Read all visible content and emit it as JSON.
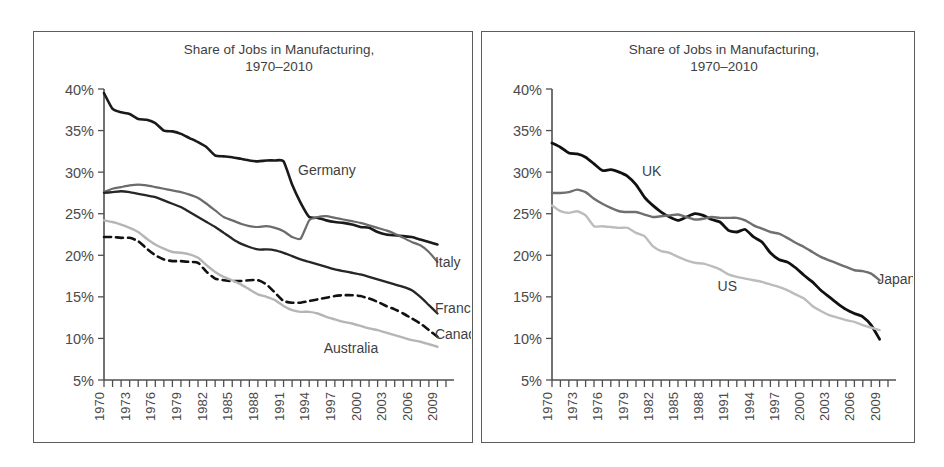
{
  "figure": {
    "background": "#ffffff",
    "frame_color": "#5c5c5c"
  },
  "chart_data": [
    {
      "panel": "left",
      "type": "line",
      "title": "Share of Jobs in Manufacturing,\n1970–2010",
      "title_line1": "Share of Jobs in Manufacturing,",
      "title_line2": "1970–2010",
      "xlabel": "",
      "ylabel": "",
      "ylim": [
        5,
        40
      ],
      "yticks": [
        5,
        10,
        15,
        20,
        25,
        30,
        35,
        40
      ],
      "ytick_labels": [
        "5%",
        "10%",
        "15%",
        "20%",
        "25%",
        "30%",
        "35%",
        "40%"
      ],
      "xlim": [
        1970,
        2010
      ],
      "xticks_every": 1,
      "xtick_labels": [
        "1970",
        "1973",
        "1976",
        "1979",
        "1982",
        "1985",
        "1988",
        "1991",
        "1994",
        "1997",
        "2000",
        "2003",
        "2006",
        "2009"
      ],
      "xtick_label_years": [
        1970,
        1973,
        1976,
        1979,
        1982,
        1985,
        1988,
        1991,
        1994,
        1997,
        2000,
        2003,
        2006,
        2009
      ],
      "grid": false,
      "legend_position": "inline-annotations",
      "x": [
        1970,
        1971,
        1972,
        1973,
        1974,
        1975,
        1976,
        1977,
        1978,
        1979,
        1980,
        1981,
        1982,
        1983,
        1984,
        1985,
        1986,
        1987,
        1988,
        1989,
        1990,
        1991,
        1992,
        1993,
        1994,
        1995,
        1996,
        1997,
        1998,
        1999,
        2000,
        2001,
        2002,
        2003,
        2004,
        2005,
        2006,
        2007,
        2008,
        2009
      ],
      "series": [
        {
          "name": "Germany",
          "color": "#1a1a1a",
          "style": "solid",
          "width": 2.6,
          "label_x": 1992,
          "label_y": 30.3,
          "values": [
            39.5,
            37.6,
            37.2,
            37.0,
            36.4,
            36.3,
            35.9,
            35.0,
            34.9,
            34.6,
            34.1,
            33.6,
            33.0,
            32.0,
            31.9,
            31.8,
            31.6,
            31.4,
            31.3,
            31.4,
            31.4,
            31.3,
            28.5,
            26.3,
            24.6,
            24.5,
            24.2,
            24.0,
            23.9,
            23.7,
            23.4,
            23.3,
            22.8,
            22.5,
            22.4,
            22.3,
            22.2,
            21.9,
            21.6,
            21.3
          ]
        },
        {
          "name": "Italy",
          "color": "#6b6b6b",
          "style": "solid",
          "width": 2.2,
          "label_x": 2008,
          "label_y": 19.2,
          "values": [
            27.6,
            28.0,
            28.2,
            28.4,
            28.5,
            28.4,
            28.2,
            28.0,
            27.8,
            27.6,
            27.3,
            26.9,
            26.2,
            25.4,
            24.6,
            24.2,
            23.8,
            23.5,
            23.4,
            23.5,
            23.3,
            22.9,
            22.2,
            22.0,
            24.2,
            24.6,
            24.7,
            24.5,
            24.3,
            24.1,
            23.9,
            23.6,
            23.3,
            23.0,
            22.6,
            22.1,
            21.6,
            21.2,
            20.4,
            19.2
          ]
        },
        {
          "name": "France",
          "color": "#262626",
          "style": "solid",
          "width": 2.3,
          "label_x": 2008,
          "label_y": 13.6,
          "values": [
            27.5,
            27.6,
            27.7,
            27.6,
            27.4,
            27.2,
            27.0,
            26.6,
            26.2,
            25.8,
            25.2,
            24.6,
            24.0,
            23.4,
            22.7,
            22.0,
            21.4,
            21.0,
            20.7,
            20.7,
            20.6,
            20.3,
            19.9,
            19.5,
            19.2,
            18.9,
            18.6,
            18.3,
            18.1,
            17.9,
            17.7,
            17.4,
            17.1,
            16.8,
            16.5,
            16.2,
            15.8,
            15.0,
            14.0,
            13.0
          ]
        },
        {
          "name": "Canada",
          "color": "#111111",
          "style": "dashed",
          "width": 2.6,
          "label_x": 2008,
          "label_y": 10.5,
          "values": [
            22.2,
            22.2,
            22.1,
            22.1,
            21.7,
            20.8,
            20.0,
            19.5,
            19.3,
            19.3,
            19.2,
            19.1,
            18.0,
            17.2,
            17.0,
            16.9,
            16.9,
            17.0,
            17.0,
            16.5,
            15.5,
            14.5,
            14.3,
            14.3,
            14.5,
            14.7,
            14.9,
            15.1,
            15.2,
            15.2,
            15.1,
            14.8,
            14.4,
            13.9,
            13.5,
            13.0,
            12.4,
            11.8,
            11.0,
            10.2
          ]
        },
        {
          "name": "Australia",
          "color": "#b5b5b5",
          "style": "solid",
          "width": 2.4,
          "label_x": 1995,
          "label_y": 8.9,
          "values": [
            24.2,
            24.0,
            23.7,
            23.3,
            22.8,
            22.0,
            21.3,
            20.8,
            20.4,
            20.3,
            20.1,
            19.7,
            18.8,
            18.0,
            17.4,
            17.0,
            16.5,
            15.9,
            15.3,
            15.0,
            14.6,
            13.9,
            13.4,
            13.2,
            13.2,
            13.0,
            12.6,
            12.3,
            12.0,
            11.8,
            11.5,
            11.2,
            11.0,
            10.7,
            10.4,
            10.1,
            9.8,
            9.6,
            9.3,
            9.0
          ]
        }
      ]
    },
    {
      "panel": "right",
      "type": "line",
      "title": "Share of Jobs in Manufacturing,\n1970–2010",
      "title_line1": "Share of Jobs in Manufacturing,",
      "title_line2": "1970–2010",
      "xlabel": "",
      "ylabel": "",
      "ylim": [
        5,
        40
      ],
      "yticks": [
        5,
        10,
        15,
        20,
        25,
        30,
        35,
        40
      ],
      "ytick_labels": [
        "5%",
        "10%",
        "15%",
        "20%",
        "25%",
        "30%",
        "35%",
        "40%"
      ],
      "xlim": [
        1970,
        2010
      ],
      "xticks_every": 1,
      "xtick_labels": [
        "1970",
        "1973",
        "1976",
        "1979",
        "1982",
        "1985",
        "1988",
        "1991",
        "1994",
        "1997",
        "2000",
        "2003",
        "2006",
        "2009"
      ],
      "xtick_label_years": [
        1970,
        1973,
        1976,
        1979,
        1982,
        1985,
        1988,
        1991,
        1994,
        1997,
        2000,
        2003,
        2006,
        2009
      ],
      "grid": false,
      "legend_position": "inline-annotations",
      "x": [
        1970,
        1971,
        1972,
        1973,
        1974,
        1975,
        1976,
        1977,
        1978,
        1979,
        1980,
        1981,
        1982,
        1983,
        1984,
        1985,
        1986,
        1987,
        1988,
        1989,
        1990,
        1991,
        1992,
        1993,
        1994,
        1995,
        1996,
        1997,
        1998,
        1999,
        2000,
        2001,
        2002,
        2003,
        2004,
        2005,
        2006,
        2007,
        2008,
        2009
      ],
      "series": [
        {
          "name": "UK",
          "color": "#111111",
          "style": "solid",
          "width": 2.8,
          "label_x": 1980,
          "label_y": 30.1,
          "values": [
            33.5,
            33.0,
            32.3,
            32.2,
            31.8,
            31.0,
            30.2,
            30.3,
            30.0,
            29.5,
            28.5,
            27.0,
            26.0,
            25.2,
            24.6,
            24.2,
            24.6,
            25.0,
            24.8,
            24.3,
            24.0,
            23.0,
            22.8,
            23.1,
            22.2,
            21.6,
            20.3,
            19.5,
            19.2,
            18.5,
            17.6,
            16.8,
            15.8,
            15.0,
            14.2,
            13.5,
            13.0,
            12.6,
            11.6,
            9.9
          ]
        },
        {
          "name": "Japan",
          "color": "#6f6f6f",
          "style": "solid",
          "width": 2.4,
          "label_x": 2008,
          "label_y": 17.2,
          "values": [
            27.5,
            27.5,
            27.6,
            27.9,
            27.6,
            26.8,
            26.2,
            25.7,
            25.3,
            25.2,
            25.2,
            24.9,
            24.6,
            24.7,
            24.8,
            24.9,
            24.6,
            24.3,
            24.4,
            24.6,
            24.5,
            24.5,
            24.5,
            24.2,
            23.6,
            23.2,
            22.8,
            22.6,
            22.1,
            21.5,
            21.0,
            20.4,
            19.8,
            19.4,
            19.0,
            18.6,
            18.2,
            18.1,
            17.8,
            17.0
          ]
        },
        {
          "name": "US",
          "color": "#bcbcbc",
          "style": "solid",
          "width": 2.4,
          "label_x": 1989,
          "label_y": 16.3,
          "values": [
            26.0,
            25.3,
            25.1,
            25.3,
            24.8,
            23.5,
            23.5,
            23.4,
            23.3,
            23.3,
            22.7,
            22.3,
            21.1,
            20.5,
            20.3,
            19.8,
            19.4,
            19.1,
            19.0,
            18.7,
            18.3,
            17.7,
            17.4,
            17.2,
            17.0,
            16.8,
            16.5,
            16.2,
            15.8,
            15.3,
            14.8,
            13.9,
            13.3,
            12.8,
            12.5,
            12.2,
            12.0,
            11.6,
            11.3,
            11.0
          ]
        }
      ]
    }
  ]
}
